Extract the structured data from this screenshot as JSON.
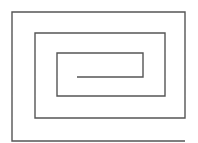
{
  "figure": {
    "type": "rectangular-spiral",
    "stroke_color": "#555555",
    "background_color": "#ffffff",
    "stroke_width": 1.4,
    "points": [
      [
        185,
        141
      ],
      [
        12,
        141
      ],
      [
        12,
        12
      ],
      [
        185,
        12
      ],
      [
        185,
        118
      ],
      [
        35,
        118
      ],
      [
        35,
        33
      ],
      [
        165,
        33
      ],
      [
        165,
        96
      ],
      [
        57,
        96
      ],
      [
        57,
        53
      ],
      [
        143,
        53
      ],
      [
        143,
        77
      ],
      [
        77,
        77
      ]
    ]
  }
}
